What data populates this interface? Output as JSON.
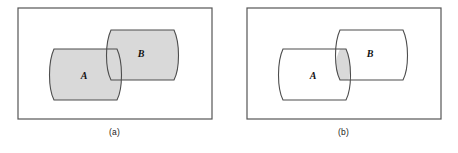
{
  "figure": {
    "panels": [
      {
        "id": "a",
        "caption": "(a)",
        "caption_name": "panel-a-caption",
        "shaded_region": "union",
        "shaded_description": "A union B",
        "sets": [
          {
            "label": "A",
            "label_x": 84,
            "label_y": 79
          },
          {
            "label": "B",
            "label_x": 141,
            "label_y": 57
          }
        ]
      },
      {
        "id": "b",
        "caption": "(b)",
        "caption_name": "panel-b-caption",
        "shaded_region": "intersection",
        "shaded_description": "A intersect B",
        "sets": [
          {
            "label": "A",
            "label_x": 84,
            "label_y": 79
          },
          {
            "label": "B",
            "label_x": 141,
            "label_y": 57
          }
        ]
      }
    ],
    "colors": {
      "shade_fill": "#d9d9d9",
      "stroke": "#4d4d4d",
      "universe_stroke": "#555555",
      "background": "#ffffff",
      "text": "#1a1a1a"
    },
    "geometry": {
      "universe_rect": {
        "x": 18,
        "y": 8,
        "width": 194,
        "height": 111
      },
      "set_a_path": "M 54 49 L 117 49 C 123 62 123 88 117 100 L 54 100 C 48 88 48 62 54 49 Z",
      "set_b_path": "M 111 30 L 174 30 C 180 43 180 68 174 80 L 111 80 C 105 68 105 43 111 30 Z",
      "intersection_path": "M 111 49 L 117 49 C 123 62 123 70 120 80 L 111 80 C 105 68 105 62 111 49 Z"
    }
  }
}
